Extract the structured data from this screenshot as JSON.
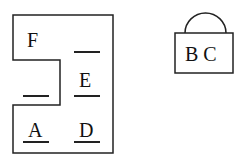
{
  "left_shape": {
    "labels": {
      "F": "F",
      "E": "E",
      "A": "A",
      "D": "D"
    },
    "blanks": [
      "top-right",
      "middle-left",
      "under-E",
      "under-A",
      "under-D"
    ]
  },
  "right_shape": {
    "label": "B C"
  },
  "colors": {
    "stroke": "#222222",
    "background": "#ffffff"
  }
}
